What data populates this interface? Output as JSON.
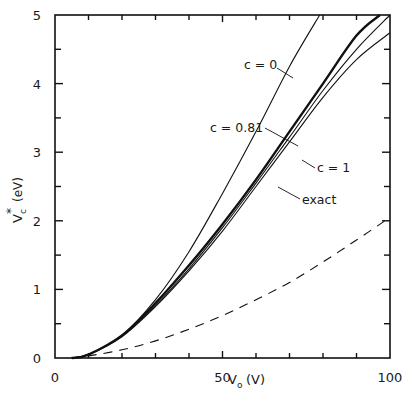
{
  "chart_data": {
    "type": "line",
    "title": "",
    "xlabel": "V_o (V)",
    "xlabel_main": "V",
    "xlabel_sub": "o",
    "xlabel_unit": "(V)",
    "ylabel": "V_c* (eV)",
    "ylabel_main": "V",
    "ylabel_sub": "c",
    "ylabel_sup": "*",
    "ylabel_unit": "(eV)",
    "xlim": [
      0,
      100
    ],
    "ylim": [
      0,
      5
    ],
    "x_ticks_major": [
      0,
      50,
      100
    ],
    "x_tick_labels": [
      "0",
      "50",
      "100"
    ],
    "x_ticks_minor": [
      10,
      20,
      30,
      40,
      60,
      70,
      80,
      90
    ],
    "y_ticks_major": [
      0,
      1,
      2,
      3,
      4,
      5
    ],
    "y_tick_labels": [
      "0",
      "1",
      "2",
      "3",
      "4",
      "5"
    ],
    "y_ticks_minor": [
      0.5,
      1.5,
      2.5,
      3.5,
      4.5
    ],
    "grid": false,
    "legend": "inline annotations",
    "series": [
      {
        "name": "c = 0",
        "style": "thin",
        "x": [
          5,
          10,
          20,
          30,
          40,
          50,
          60,
          70,
          79
        ],
        "y": [
          0,
          0.05,
          0.33,
          0.85,
          1.55,
          2.4,
          3.3,
          4.25,
          5.0
        ]
      },
      {
        "name": "c = 0.81",
        "style": "thick",
        "x": [
          5,
          10,
          20,
          30,
          40,
          50,
          60,
          70,
          80,
          90,
          97
        ],
        "y": [
          0,
          0.05,
          0.33,
          0.8,
          1.35,
          1.95,
          2.6,
          3.3,
          4.0,
          4.7,
          5.0
        ]
      },
      {
        "name": "c = 1",
        "style": "thin",
        "x": [
          5,
          10,
          20,
          30,
          40,
          50,
          60,
          70,
          80,
          90,
          100
        ],
        "y": [
          0,
          0.05,
          0.31,
          0.75,
          1.27,
          1.85,
          2.5,
          3.15,
          3.8,
          4.35,
          4.74
        ]
      },
      {
        "name": "exact",
        "style": "thin",
        "x": [
          5,
          10,
          20,
          30,
          40,
          50,
          60,
          70,
          80,
          90,
          100
        ],
        "y": [
          0,
          0.05,
          0.32,
          0.77,
          1.3,
          1.9,
          2.55,
          3.22,
          3.9,
          4.5,
          5.0
        ]
      },
      {
        "name": "dashed",
        "style": "dashed",
        "x": [
          5,
          10,
          20,
          30,
          40,
          50,
          60,
          70,
          80,
          90,
          100
        ],
        "y": [
          0,
          0.03,
          0.12,
          0.25,
          0.42,
          0.62,
          0.85,
          1.1,
          1.4,
          1.72,
          2.05
        ]
      }
    ],
    "annotations": [
      {
        "text": "c  = 0",
        "target": "c = 0"
      },
      {
        "text": "c  = 0.81",
        "target": "c = 0.81"
      },
      {
        "text": "c  = 1",
        "target": "c = 1"
      },
      {
        "text": "exact",
        "target": "exact"
      }
    ]
  }
}
